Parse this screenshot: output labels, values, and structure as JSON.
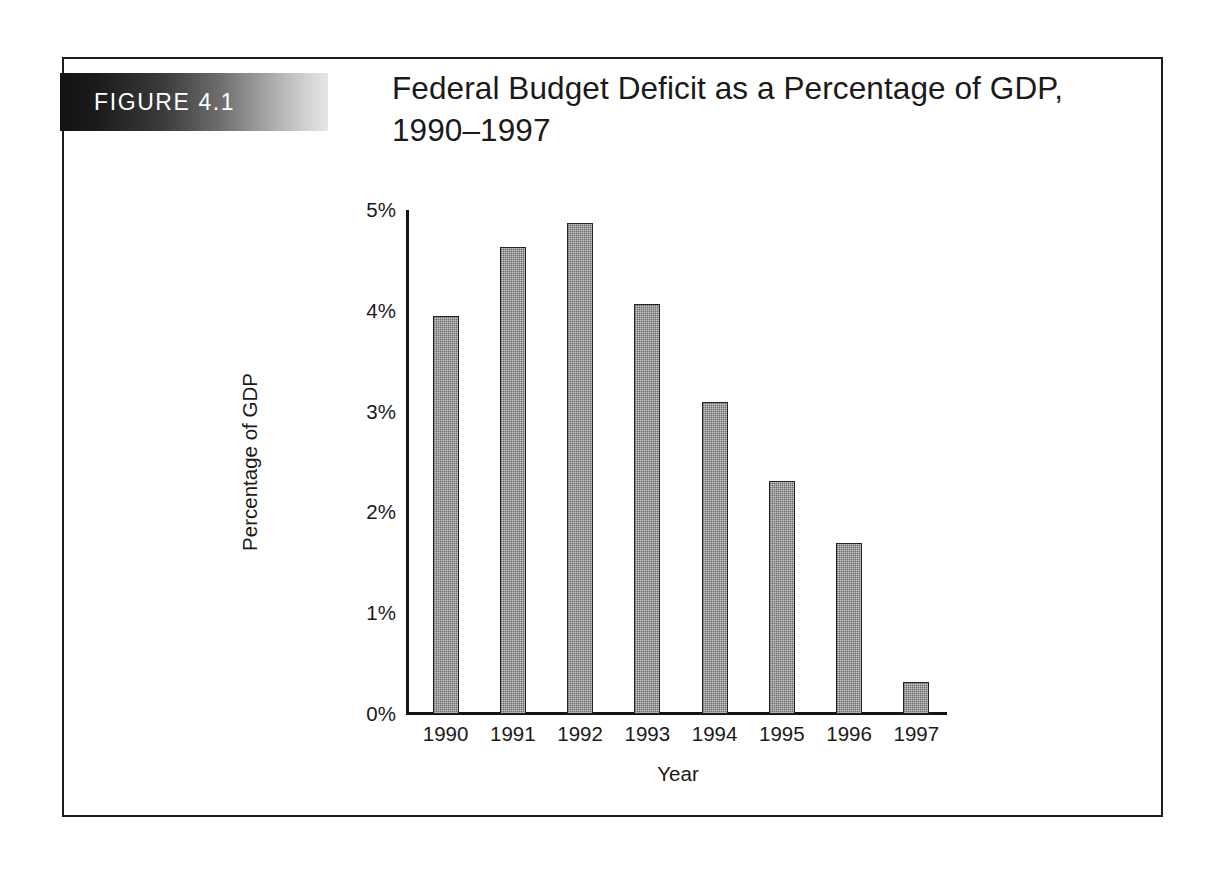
{
  "figure": {
    "badge_label": "FIGURE 4.1",
    "title": "Federal Budget Deficit as a Percentage of GDP, 1990–1997",
    "frame_color": "#1d1d1d",
    "badge_gradient_from": "#121212",
    "badge_gradient_to": "#e6e6e6"
  },
  "chart_data": {
    "type": "bar",
    "title": "Federal Budget Deficit as a Percentage of GDP, 1990–1997",
    "xlabel": "Year",
    "ylabel": "Percentage of GDP",
    "categories": [
      "1990",
      "1991",
      "1992",
      "1993",
      "1994",
      "1995",
      "1996",
      "1997"
    ],
    "values": [
      3.95,
      4.63,
      4.87,
      4.07,
      3.1,
      2.31,
      1.7,
      0.32
    ],
    "ylim": [
      0,
      5
    ],
    "ytick_values": [
      0,
      1,
      2,
      3,
      4,
      5
    ],
    "ytick_labels": [
      "0%",
      "1%",
      "2%",
      "3%",
      "4%",
      "5%"
    ],
    "grid": false,
    "legend": false,
    "bar_color": "#8a8a8a",
    "bar_border_color": "#242424",
    "axis_color": "#141414"
  }
}
